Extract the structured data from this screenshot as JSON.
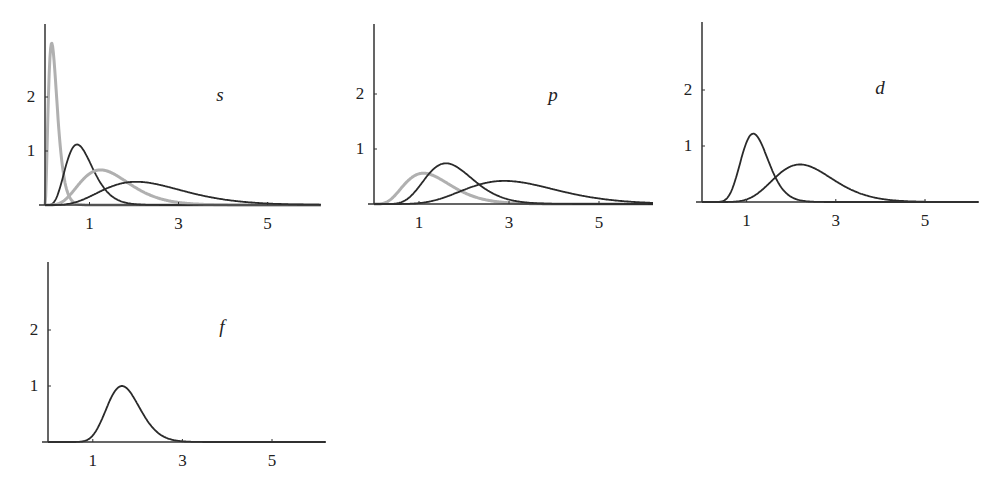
{
  "chart_data": [
    {
      "type": "line",
      "title": "s",
      "xlabel": "",
      "ylabel": "",
      "xticks": [
        1,
        3,
        5
      ],
      "yticks": [
        1,
        2
      ],
      "xlim": [
        0,
        6.2
      ],
      "ylim": [
        0,
        3.3
      ],
      "grid": false,
      "legend": "none",
      "series": [
        {
          "name": "s curve 1 (gray)",
          "color": "#b0b0b0",
          "peak_x": 0.15,
          "peak_y": 3.0,
          "shape_k": 2.2
        },
        {
          "name": "s curve 2 (black)",
          "color": "#2a2a2a",
          "peak_x": 0.72,
          "peak_y": 1.12,
          "shape_k": 5.5
        },
        {
          "name": "s curve 3 (gray)",
          "color": "#b0b0b0",
          "peak_x": 1.25,
          "peak_y": 0.65,
          "shape_k": 5
        },
        {
          "name": "s curve 4 (black)",
          "color": "#2a2a2a",
          "peak_x": 2.05,
          "peak_y": 0.43,
          "shape_k": 5
        }
      ]
    },
    {
      "type": "line",
      "title": "p",
      "xlabel": "",
      "ylabel": "",
      "xticks": [
        1,
        3,
        5
      ],
      "yticks": [
        1,
        2
      ],
      "xlim": [
        0,
        6.2
      ],
      "ylim": [
        0,
        3.3
      ],
      "grid": false,
      "legend": "none",
      "series": [
        {
          "name": "p curve 1 (gray)",
          "color": "#b0b0b0",
          "peak_x": 1.1,
          "peak_y": 0.56,
          "shape_k": 4.5
        },
        {
          "name": "p curve 2 (black)",
          "color": "#2a2a2a",
          "peak_x": 1.6,
          "peak_y": 0.74,
          "shape_k": 9
        },
        {
          "name": "p curve 3 (black)",
          "color": "#2a2a2a",
          "peak_x": 2.9,
          "peak_y": 0.42,
          "shape_k": 8
        }
      ]
    },
    {
      "type": "line",
      "title": "d",
      "xlabel": "",
      "ylabel": "",
      "xticks": [
        1,
        3,
        5
      ],
      "yticks": [
        1,
        2
      ],
      "xlim": [
        0,
        6.2
      ],
      "ylim": [
        0,
        3.3
      ],
      "grid": false,
      "legend": "none",
      "series": [
        {
          "name": "d curve 1 (black)",
          "color": "#2a2a2a",
          "peak_x": 1.15,
          "peak_y": 1.22,
          "shape_k": 14
        },
        {
          "name": "d curve 2 (black)",
          "color": "#2a2a2a",
          "peak_x": 2.2,
          "peak_y": 0.67,
          "shape_k": 11
        }
      ]
    },
    {
      "type": "line",
      "title": "f",
      "xlabel": "",
      "ylabel": "",
      "xticks": [
        1,
        3,
        5
      ],
      "yticks": [
        1,
        2
      ],
      "xlim": [
        0,
        6.2
      ],
      "ylim": [
        0,
        3.3
      ],
      "grid": false,
      "legend": "none",
      "series": [
        {
          "name": "f curve 1 (black)",
          "color": "#2a2a2a",
          "peak_x": 1.65,
          "peak_y": 1.0,
          "shape_k": 20
        }
      ]
    }
  ],
  "layout": {
    "panels": [
      {
        "left": 0,
        "top": 0,
        "origin_x": 45,
        "origin_y": 205,
        "x_scale": 44.5,
        "y_scale": 54,
        "axis_top": 24,
        "axis_right": 320,
        "label_x": 220,
        "label_y": 95
      },
      {
        "left": 0,
        "top": 0,
        "origin_x": 374,
        "origin_y": 204,
        "x_scale": 45,
        "y_scale": 55,
        "axis_top": 24,
        "axis_right": 648,
        "label_x": 553,
        "label_y": 95
      },
      {
        "left": 0,
        "top": 0,
        "origin_x": 702,
        "origin_y": 202,
        "x_scale": 44.6,
        "y_scale": 56,
        "axis_top": 22,
        "axis_right": 977,
        "label_x": 880,
        "label_y": 88
      },
      {
        "left": 0,
        "top": 0,
        "origin_x": 48,
        "origin_y": 442,
        "x_scale": 44.8,
        "y_scale": 56,
        "axis_top": 262,
        "axis_right": 324,
        "label_x": 222,
        "label_y": 327
      }
    ]
  }
}
